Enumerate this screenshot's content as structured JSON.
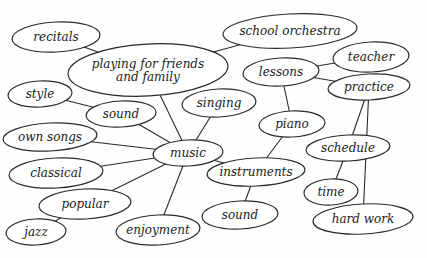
{
  "diagram": {
    "type": "concept-map",
    "center": "music",
    "nodes": [
      {
        "id": "recitals",
        "lines": [
          "recitals"
        ],
        "cx": 56,
        "cy": 37,
        "rx": 44,
        "ry": 15
      },
      {
        "id": "playing",
        "lines": [
          "playing for friends",
          "and family"
        ],
        "cx": 148,
        "cy": 70,
        "rx": 80,
        "ry": 26
      },
      {
        "id": "school-orchestra",
        "lines": [
          "school orchestra"
        ],
        "cx": 290,
        "cy": 31,
        "rx": 67,
        "ry": 17
      },
      {
        "id": "lessons",
        "lines": [
          "lessons"
        ],
        "cx": 281,
        "cy": 72,
        "rx": 38,
        "ry": 14
      },
      {
        "id": "teacher",
        "lines": [
          "teacher"
        ],
        "cx": 371,
        "cy": 57,
        "rx": 38,
        "ry": 15
      },
      {
        "id": "practice",
        "lines": [
          "practice"
        ],
        "cx": 369,
        "cy": 87,
        "rx": 41,
        "ry": 13
      },
      {
        "id": "style",
        "lines": [
          "style"
        ],
        "cx": 40,
        "cy": 94,
        "rx": 32,
        "ry": 13
      },
      {
        "id": "sound-left",
        "lines": [
          "sound"
        ],
        "cx": 121,
        "cy": 114,
        "rx": 35,
        "ry": 13
      },
      {
        "id": "singing",
        "lines": [
          "singing"
        ],
        "cx": 219,
        "cy": 103,
        "rx": 37,
        "ry": 14
      },
      {
        "id": "own-songs",
        "lines": [
          "own songs"
        ],
        "cx": 50,
        "cy": 137,
        "rx": 47,
        "ry": 14
      },
      {
        "id": "piano",
        "lines": [
          "piano"
        ],
        "cx": 292,
        "cy": 124,
        "rx": 33,
        "ry": 13
      },
      {
        "id": "music",
        "lines": [
          "music"
        ],
        "cx": 188,
        "cy": 153,
        "rx": 35,
        "ry": 13
      },
      {
        "id": "schedule",
        "lines": [
          "schedule"
        ],
        "cx": 348,
        "cy": 148,
        "rx": 42,
        "ry": 13
      },
      {
        "id": "classical",
        "lines": [
          "classical"
        ],
        "cx": 56,
        "cy": 173,
        "rx": 47,
        "ry": 15
      },
      {
        "id": "instruments",
        "lines": [
          "instruments"
        ],
        "cx": 256,
        "cy": 172,
        "rx": 49,
        "ry": 14
      },
      {
        "id": "time",
        "lines": [
          "time"
        ],
        "cx": 331,
        "cy": 192,
        "rx": 27,
        "ry": 13
      },
      {
        "id": "popular",
        "lines": [
          "popular"
        ],
        "cx": 85,
        "cy": 204,
        "rx": 46,
        "ry": 15
      },
      {
        "id": "sound-right",
        "lines": [
          "sound"
        ],
        "cx": 240,
        "cy": 215,
        "rx": 38,
        "ry": 14
      },
      {
        "id": "jazz",
        "lines": [
          "jazz"
        ],
        "cx": 36,
        "cy": 232,
        "rx": 30,
        "ry": 13
      },
      {
        "id": "enjoyment",
        "lines": [
          "enjoyment"
        ],
        "cx": 158,
        "cy": 230,
        "rx": 42,
        "ry": 15
      },
      {
        "id": "hard-work",
        "lines": [
          "hard work"
        ],
        "cx": 363,
        "cy": 219,
        "rx": 50,
        "ry": 15
      }
    ],
    "edges": [
      [
        "recitals",
        "playing"
      ],
      [
        "playing",
        "school-orchestra"
      ],
      [
        "playing",
        "music"
      ],
      [
        "style",
        "sound-left"
      ],
      [
        "sound-left",
        "music"
      ],
      [
        "singing",
        "music"
      ],
      [
        "own-songs",
        "music"
      ],
      [
        "classical",
        "music"
      ],
      [
        "popular",
        "music"
      ],
      [
        "popular",
        "jazz"
      ],
      [
        "enjoyment",
        "music"
      ],
      [
        "music",
        "instruments"
      ],
      [
        "instruments",
        "piano"
      ],
      [
        "piano",
        "lessons"
      ],
      [
        "lessons",
        "teacher"
      ],
      [
        "lessons",
        "practice"
      ],
      [
        "practice",
        "schedule"
      ],
      [
        "practice",
        "hard-work"
      ],
      [
        "schedule",
        "time"
      ],
      [
        "instruments",
        "sound-right"
      ]
    ]
  }
}
